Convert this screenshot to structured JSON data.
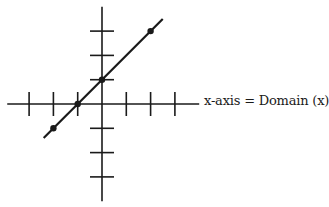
{
  "diagram": {
    "type": "coordinate-plane-linear-graph",
    "x_axis_label": "x-axis = Domain (x)",
    "colors": {
      "axis": "#1a1a1a",
      "line": "#1a1a1a",
      "background": "#ffffff"
    }
  },
  "chart_data": {
    "type": "line",
    "title": "",
    "xlabel": "x-axis = Domain (x)",
    "ylabel": "",
    "grid": false,
    "xlim": [
      -3.9,
      4
    ],
    "ylim": [
      -4,
      4
    ],
    "x_ticks": [
      -3,
      -2,
      -1,
      1,
      2,
      3
    ],
    "y_ticks": [
      -3,
      -2,
      -1,
      1,
      2,
      3
    ],
    "series": [
      {
        "name": "y = x + 1",
        "line_x": [
          -2.4,
          2.5
        ],
        "line_y": [
          -1.4,
          3.5
        ],
        "marked_points": [
          {
            "x": -2,
            "y": -1
          },
          {
            "x": -1,
            "y": 0
          },
          {
            "x": 0,
            "y": 1
          },
          {
            "x": 2,
            "y": 3
          }
        ]
      }
    ]
  }
}
